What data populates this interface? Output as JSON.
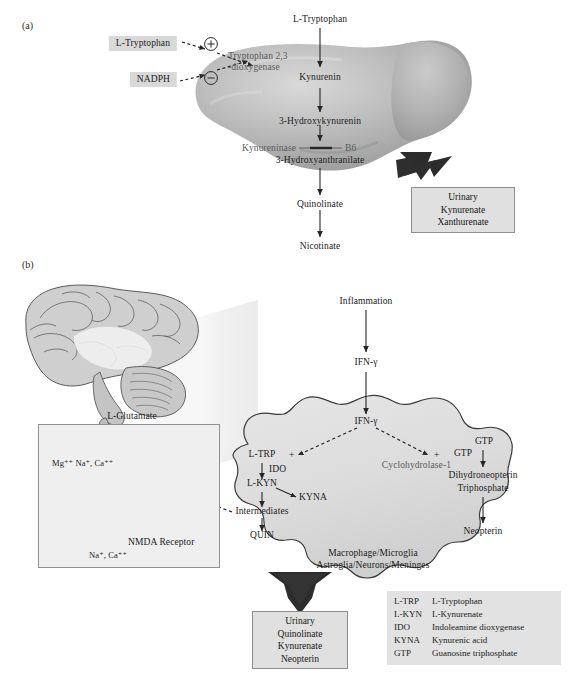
{
  "figure": {
    "panel_a_letter": "(a)",
    "panel_b_letter": "(b)"
  },
  "panel_a": {
    "title_node": "L-Tryptophan",
    "regulators": [
      {
        "name": "L-Tryptophan",
        "sign": "+"
      },
      {
        "name": "NADPH",
        "sign": "−"
      }
    ],
    "enzyme_top_line1": "Tryptophan 2,3",
    "enzyme_top_line2": "-dioxygenase",
    "pathway": [
      "L-Tryptophan",
      "Kynurenin",
      "3-Hydroxykynurenin",
      "3-Hydroxyanthranilate",
      "Quinolinate",
      "Nicotinate"
    ],
    "enzyme_mid": "Kynureninase",
    "cofactor_mid": "B6",
    "organ": "liver",
    "output_box": {
      "line1": "Urinary",
      "line2": "Kynurenate",
      "line3": "Xanthurenate"
    }
  },
  "panel_b": {
    "brain_label": "brain-illustration",
    "inset": {
      "ligand": "L-Glutamate",
      "ions_top": "Mg⁺⁺  Na⁺, Ca⁺⁺",
      "receptor": "NMDA Receptor",
      "ions_bottom": "Na⁺, Ca⁺⁺",
      "plus_sign": "+"
    },
    "stimulus": "Inflammation",
    "cytokine_outside": "IFN-γ",
    "cytokine_inside": "IFN-γ",
    "plus_left": "+",
    "plus_right": "+",
    "left_branch": {
      "substrate": "L-TRP",
      "enzyme": "IDO",
      "product": "L-KYN",
      "side_product": "KYNA",
      "intermediates": "Intermediates",
      "end_product": "QUIN"
    },
    "right_branch": {
      "substrate_top": "GTP",
      "substrate": "GTP",
      "enzyme": "Cyclohydrolase-1",
      "product_line1": "Dihydroneopterin",
      "product_line2": "Triphosphate",
      "end_product": "Neopterin"
    },
    "cell_label_line1": "Macrophage/Microglia",
    "cell_label_line2": "Astroglia/Neurons/Meninges",
    "output_box": {
      "line1": "Urinary",
      "line2": "Quinolinate",
      "line3": "Kynurenate",
      "line4": "Neopterin"
    },
    "legend": {
      "rows": [
        {
          "abbr": "L-TRP",
          "meaning": "L-Tryptophan"
        },
        {
          "abbr": "L-KYN",
          "meaning": "L-Kynurenate"
        },
        {
          "abbr": "IDO",
          "meaning": "Indoleamine dioxygenase"
        },
        {
          "abbr": "KYNA",
          "meaning": "Kynurenic acid"
        },
        {
          "abbr": "GTP",
          "meaning": "Guanosine triphosphate"
        }
      ]
    }
  },
  "colors": {
    "highlight_bg": "#d9d9d9",
    "box_bg": "#e0e0e0",
    "box_border": "#8e8e8e",
    "arrow": "#262626",
    "text": "#1b1b1b",
    "organ_fill": "#a9a9a9",
    "cell_fill": "#dedede"
  }
}
